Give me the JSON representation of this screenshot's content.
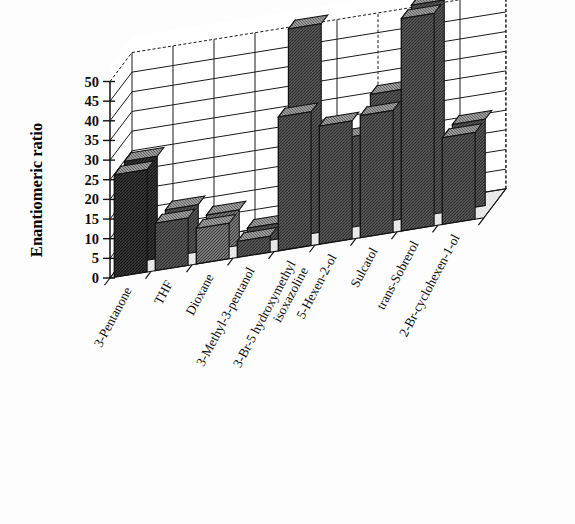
{
  "chart_data": {
    "type": "bar",
    "title": "",
    "subtitle": "",
    "xlabel": "",
    "ylabel": "Enantiomeric ratio",
    "ylim": [
      0,
      50
    ],
    "yticks": [
      0,
      5,
      10,
      15,
      20,
      25,
      30,
      35,
      40,
      45,
      50
    ],
    "ytick_labels": [
      "0",
      "5",
      "10",
      "15",
      "20",
      "25",
      "30",
      "35",
      "40",
      "45",
      "50"
    ],
    "grid": true,
    "legend": "none",
    "projection": "3d-depth-two-rows",
    "categories": [
      "3-Pentanone",
      "THF",
      "Dioxane",
      "3-Methyl-3-pentanol",
      "3-Br-5 hydroxymethyl isoxazoline",
      "5-Hexen-2-ol",
      "Sulcatol",
      "trans-Sobrerol",
      "2-Br-cyclohexen-1-ol"
    ],
    "category_label_lines": [
      [
        "3-Pentanone"
      ],
      [
        "THF"
      ],
      [
        "Dioxane"
      ],
      [
        "3-Methyl-3-pentanol"
      ],
      [
        "3-Br-5 hydroxymethyl",
        "isoxazoline"
      ],
      [
        "5-Hexen-2-ol"
      ],
      [
        "Sulcatol"
      ],
      [
        "trans-Sobrerol"
      ],
      [
        "2-Br-cyclohexen-1-ol"
      ]
    ],
    "series": [
      {
        "name": "back-row",
        "values": [
          26,
          12,
          9,
          4,
          53,
          23,
          33,
          54,
          22
        ]
      },
      {
        "name": "front-row",
        "values": [
          26,
          12,
          9,
          4,
          34,
          30,
          31,
          54,
          22
        ]
      }
    ],
    "values": [
      26,
      12,
      9,
      4,
      53,
      23,
      33,
      54,
      22
    ]
  },
  "colors": {
    "bar_dark": "#4a4a4a",
    "bar_mid": "#6e6e6e",
    "bar_light": "#b9b9b9",
    "bar_pale": "#d8d8d8",
    "bar_black": "#2a2a2a",
    "floor": "#e8e8e8",
    "wall": "#ffffff",
    "outline": "#121212",
    "background": "#fdfdfd"
  }
}
